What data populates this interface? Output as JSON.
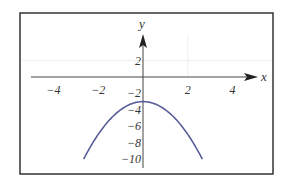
{
  "chart_data": {
    "type": "line",
    "title": "",
    "xlabel": "x",
    "ylabel": "y",
    "function": "y = -x^2 - 3",
    "xlim": [
      -5.3,
      5.3
    ],
    "ylim": [
      -11,
      7.6
    ],
    "x_ticks": [
      -4,
      -2,
      2,
      4
    ],
    "y_ticks": [
      2,
      -2,
      -4,
      -6,
      -8,
      -10
    ],
    "x_tick_labels": [
      "−4",
      "−2",
      "2",
      "4"
    ],
    "y_tick_labels": [
      "2",
      "−2",
      "−4",
      "−6",
      "−8",
      "−10"
    ],
    "grid": true,
    "legend": null,
    "series": [
      {
        "name": "parabola",
        "color": "#5a5f9a",
        "x": [
          -2.65,
          -2,
          -1,
          0,
          1,
          2,
          2.65
        ],
        "y": [
          -10.0,
          -7.0,
          -4.0,
          -3.0,
          -4.0,
          -7.0,
          -10.0
        ]
      }
    ]
  },
  "colors": {
    "frame": "#333333",
    "axes": "#333333",
    "curve": "#5a5f9a",
    "grid": "#eeeeee"
  }
}
